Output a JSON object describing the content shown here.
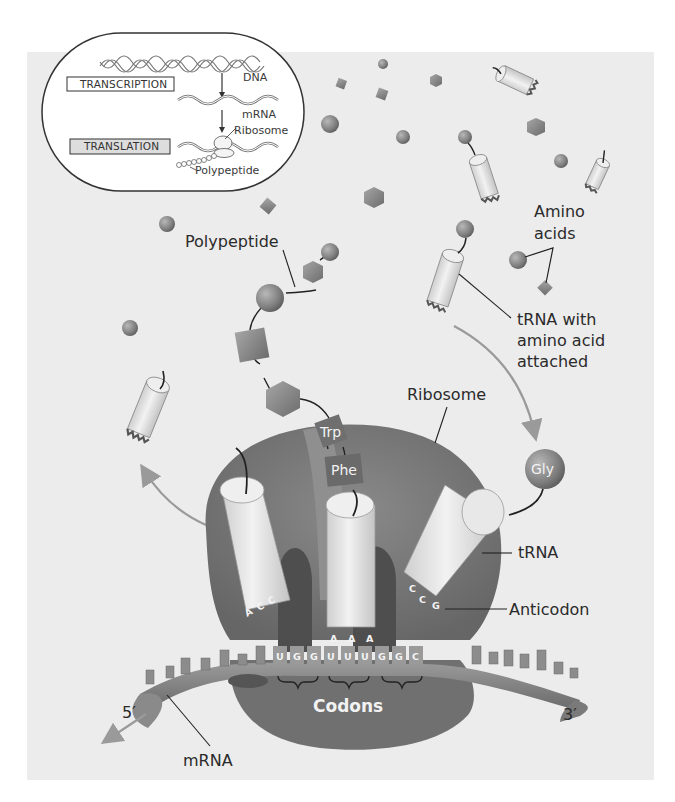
{
  "figure": {
    "colors": {
      "page_bg": "#ffffff",
      "panel_bg": "#ececec",
      "ribosome": "#7b7b7b",
      "ribosome_dark": "#5c5c5c",
      "trna_body": "#e4e4e4",
      "amino_acid": "#8a8a8a",
      "arrow": "#9a9a9a",
      "text": "#2a2a2a"
    }
  },
  "inset": {
    "dna_label": "DNA",
    "mrna_label": "mRNA",
    "ribosome_label": "Ribosome",
    "polypeptide_label": "Polypeptide",
    "transcription_box": "TRANSCRIPTION",
    "translation_box": "TRANSLATION"
  },
  "labels": {
    "polypeptide": "Polypeptide",
    "amino_acids_line1": "Amino",
    "amino_acids_line2": "acids",
    "trna_attached_line1": "tRNA with",
    "trna_attached_line2": "amino acid",
    "trna_attached_line3": "attached",
    "ribosome": "Ribosome",
    "trna": "tRNA",
    "anticodon": "Anticodon",
    "codons": "Codons",
    "mrna": "mRNA",
    "five_prime": "5′",
    "three_prime": "3′"
  },
  "amino_acid_tags": {
    "trp": "Trp",
    "phe": "Phe",
    "gly": "Gly"
  },
  "anticodons": {
    "left": [
      "A",
      "C",
      "C"
    ],
    "middle": [
      "A",
      "A",
      "A"
    ],
    "right": [
      "C",
      "C",
      "G"
    ]
  },
  "codons": [
    "U",
    "G",
    "G",
    "U",
    "U",
    "U",
    "G",
    "G",
    "C"
  ]
}
